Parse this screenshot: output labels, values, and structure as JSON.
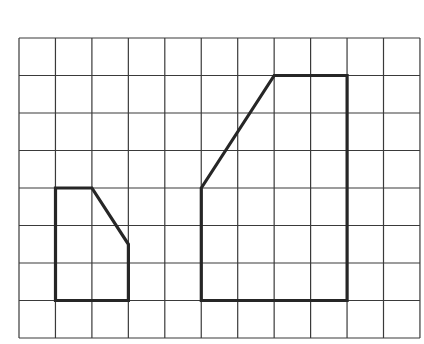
{
  "grid": {
    "columns": 11,
    "rows": 8,
    "origin_px": [
      19,
      38
    ],
    "cell_width_px": 36.45,
    "cell_height_px": 37.5,
    "line_color": "#3a3a3a"
  },
  "shapes": [
    {
      "name": "small-pentagon",
      "stroke_color": "#262626",
      "vertices_grid": [
        [
          1,
          4
        ],
        [
          2,
          4
        ],
        [
          3,
          5.5
        ],
        [
          3,
          7
        ],
        [
          1,
          7
        ]
      ]
    },
    {
      "name": "large-pentagon",
      "stroke_color": "#262626",
      "vertices_grid": [
        [
          5,
          4
        ],
        [
          7,
          1
        ],
        [
          9,
          1
        ],
        [
          9,
          7
        ],
        [
          5,
          7
        ]
      ]
    }
  ]
}
